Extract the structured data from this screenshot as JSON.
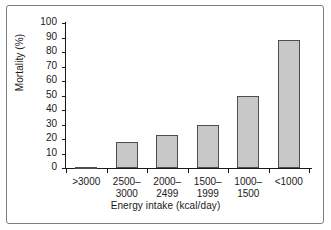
{
  "chart_data": {
    "type": "bar",
    "title": "",
    "subtitle": "",
    "xlabel": "Energy intake (kcal/day)",
    "ylabel": "Mortality (%)",
    "categories": [
      ">3000",
      "2500–\n3000",
      "2000–\n2499",
      "1500–\n1999",
      "1000–\n1500",
      "<1000"
    ],
    "values": [
      1,
      18,
      23,
      30,
      50,
      88
    ],
    "ylim": [
      0,
      100
    ],
    "yticks": [
      0,
      10,
      20,
      30,
      40,
      50,
      60,
      70,
      80,
      90,
      100
    ],
    "ytick_labels": [
      "0",
      "10",
      "20",
      "30",
      "40",
      "50",
      "60",
      "70",
      "80",
      "90",
      "100"
    ],
    "grid": false,
    "legend": null,
    "legend_position": "none",
    "annotations": [],
    "series": [
      {
        "name": "Mortality",
        "values": [
          1,
          18,
          23,
          30,
          50,
          88
        ],
        "fill_color": "#c8c8c8",
        "edge_color": "#4d4d4d"
      }
    ]
  },
  "figure": {
    "frame_color": "#7d7d7d",
    "background": "#ffffff",
    "axis_color": "#1a1a1a"
  }
}
